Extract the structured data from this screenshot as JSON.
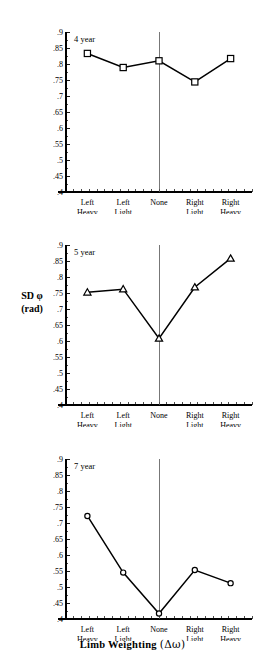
{
  "figure": {
    "y_axis_label_line1": "SD φ",
    "y_axis_label_line2": "(rad)",
    "x_axis_title_main": "Limb Weighting",
    "x_axis_title_paren": "(Δω)"
  },
  "chart_data": [
    {
      "type": "line",
      "title": "4 year",
      "categories": [
        "Left Heavy",
        "Left Light",
        "None",
        "Right Light",
        "Right Heavy"
      ],
      "category_lines": [
        [
          "Left",
          "Heavy"
        ],
        [
          "Left",
          "Light"
        ],
        [
          "None",
          ""
        ],
        [
          "Right",
          "Light"
        ],
        [
          "Right",
          "Heavy"
        ]
      ],
      "values": [
        0.833,
        0.789,
        0.81,
        0.744,
        0.817
      ],
      "marker": "open-square",
      "xlabel": "Limb Weighting (Δω)",
      "ylabel": "SD φ (rad)",
      "ylim": [
        0.4,
        0.9
      ],
      "ytick_step": 0.05,
      "ytick_labels": [
        ".9",
        ".85",
        ".8",
        ".75",
        ".7",
        ".65",
        ".6",
        ".55",
        ".5",
        ".45",
        ".4"
      ],
      "grid": false,
      "legend": "none",
      "reference_line_at": "None"
    },
    {
      "type": "line",
      "title": "5 year",
      "categories": [
        "Left Heavy",
        "Left Light",
        "None",
        "Right Light",
        "Right Heavy"
      ],
      "category_lines": [
        [
          "Left",
          "Heavy"
        ],
        [
          "Left",
          "Light"
        ],
        [
          "None",
          ""
        ],
        [
          "Right",
          "Light"
        ],
        [
          "Right",
          "Heavy"
        ]
      ],
      "values": [
        0.752,
        0.762,
        0.608,
        0.768,
        0.858
      ],
      "marker": "open-triangle",
      "xlabel": "Limb Weighting (Δω)",
      "ylabel": "SD φ (rad)",
      "ylim": [
        0.4,
        0.9
      ],
      "ytick_step": 0.05,
      "ytick_labels": [
        ".9",
        ".85",
        ".8",
        ".75",
        ".7",
        ".65",
        ".6",
        ".55",
        ".5",
        ".45",
        ".4"
      ],
      "grid": false,
      "legend": "none",
      "reference_line_at": "None"
    },
    {
      "type": "line",
      "title": "7 year",
      "categories": [
        "Left Heavy",
        "Left Light",
        "None",
        "Right Light",
        "Right Heavy"
      ],
      "category_lines": [
        [
          "Left",
          "Heavy"
        ],
        [
          "Left",
          "Light"
        ],
        [
          "None",
          ""
        ],
        [
          "Right",
          "Light"
        ],
        [
          "Right",
          "Heavy"
        ]
      ],
      "values": [
        0.722,
        0.545,
        0.417,
        0.553,
        0.512
      ],
      "marker": "open-circle",
      "xlabel": "Limb Weighting (Δω)",
      "ylabel": "SD φ (rad)",
      "ylim": [
        0.4,
        0.9
      ],
      "ytick_step": 0.05,
      "ytick_labels": [
        ".9",
        ".85",
        ".8",
        ".75",
        ".7",
        ".65",
        ".6",
        ".55",
        ".5",
        ".45",
        ".4"
      ],
      "grid": false,
      "legend": "none",
      "reference_line_at": "None"
    }
  ]
}
